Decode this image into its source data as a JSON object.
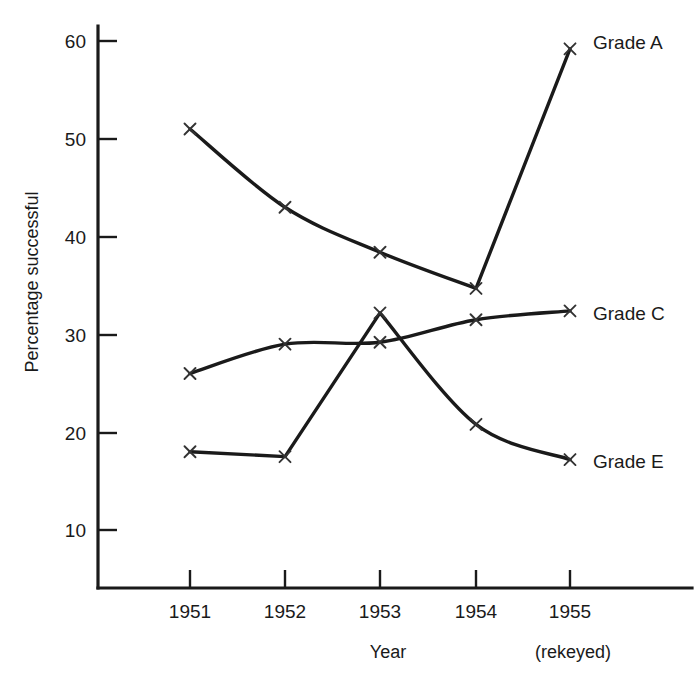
{
  "chart_data": {
    "type": "line",
    "title": "",
    "xlabel": "Year",
    "ylabel": "Percentage successful",
    "x_note": "(rekeyed)",
    "categories": [
      "1951",
      "1952",
      "1953",
      "1954",
      "1955"
    ],
    "xlim": [
      1950.5,
      1955.5
    ],
    "ylim": [
      5,
      63
    ],
    "yticks": [
      10,
      20,
      30,
      40,
      50,
      60
    ],
    "ytick_labels": [
      "10",
      "20",
      "30",
      "40",
      "50",
      "60"
    ],
    "grid": false,
    "legend_position": "right-inline",
    "marker": "x",
    "line_color": "#1a1a1a",
    "series": [
      {
        "name": "Grade A",
        "label": "Grade A",
        "values": [
          51.0,
          43.0,
          38.4,
          34.7,
          59.2
        ]
      },
      {
        "name": "Grade C",
        "label": "Grade C",
        "values": [
          26.0,
          29.0,
          29.2,
          31.5,
          32.4
        ]
      },
      {
        "name": "Grade E",
        "label": "Grade E",
        "values": [
          18.0,
          17.5,
          32.2,
          20.8,
          17.2
        ]
      }
    ]
  },
  "axes": {
    "y_axis_title": "Percentage successful",
    "x_axis_title": "Year",
    "x_axis_note": "(rekeyed)"
  },
  "yticks": {
    "t0": "10",
    "t1": "20",
    "t2": "30",
    "t3": "40",
    "t4": "50",
    "t5": "60"
  },
  "xticks": {
    "t0": "1951",
    "t1": "1952",
    "t2": "1953",
    "t3": "1954",
    "t4": "1955"
  },
  "legend": {
    "a": "Grade A",
    "c": "Grade C",
    "e": "Grade E"
  }
}
